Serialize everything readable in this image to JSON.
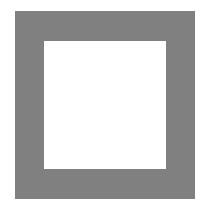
{
  "figure": {
    "shape": "square-frame",
    "colors": {
      "frame": "#808080",
      "interior": "#ffffff",
      "background": "#ffffff"
    }
  }
}
